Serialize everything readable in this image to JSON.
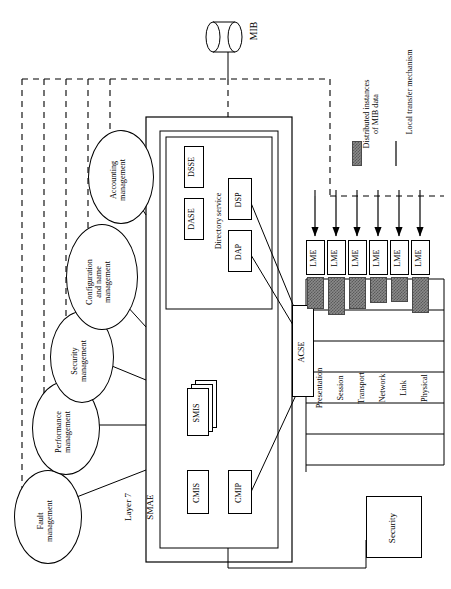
{
  "diagram": {
    "mib": {
      "label": "MIB",
      "shape": "cylinder-icon"
    },
    "layer7_label": "Layer 7",
    "smae_label": "SMAE",
    "directory_service_label": "Directory service",
    "acse_label": "ACSE",
    "security_label": "Security",
    "management_functions": [
      {
        "label": "Fault\nmanagement",
        "name": "fault-management"
      },
      {
        "label": "Performance\nmanagement",
        "name": "performance-management"
      },
      {
        "label": "Security\nmanagement",
        "name": "security-management"
      },
      {
        "label": "Configuration\nand name\nmanagement",
        "name": "configuration-and-name-management"
      },
      {
        "label": "Accounting\nmanagement",
        "name": "accounting-management"
      }
    ],
    "smae_elements": [
      {
        "label": "CMIS",
        "name": "cmis-box"
      },
      {
        "label": "SMIS",
        "name": "smis-box"
      },
      {
        "label": "CMIP",
        "name": "cmip-box"
      }
    ],
    "directory_elements": [
      {
        "label": "DASE",
        "name": "dase-box"
      },
      {
        "label": "DSSE",
        "name": "dsse-box"
      },
      {
        "label": "DAP",
        "name": "dap-box"
      },
      {
        "label": "DSP",
        "name": "dsp-box"
      }
    ],
    "layers": [
      {
        "label": "Presentation",
        "lme": "LME"
      },
      {
        "label": "Session",
        "lme": "LME"
      },
      {
        "label": "Transport",
        "lme": "LME"
      },
      {
        "label": "Network",
        "lme": "LME"
      },
      {
        "label": "Link",
        "lme": "LME"
      },
      {
        "label": "Physical",
        "lme": "LME"
      }
    ],
    "legend": [
      {
        "label": "Distributed instances\nof MIB data",
        "swatch": "hatched-block",
        "name": "legend-distributed-mib"
      },
      {
        "label": "Local transfer mechanism",
        "swatch": "solid-line",
        "name": "legend-local-transfer"
      }
    ],
    "colors": {
      "stroke": "#000000",
      "hatch_fill": "#8a8a8a",
      "hatch_line": "#5a5a5a",
      "background": "#ffffff"
    }
  }
}
